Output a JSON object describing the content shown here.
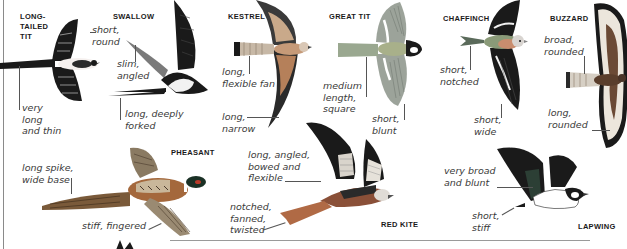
{
  "figure": {
    "birds": [
      {
        "id": "long-tailed-tit",
        "name": "LONG-\nTAILED\nTIT",
        "annotations": [
          {
            "part": "wing",
            "text": "short,\nround"
          },
          {
            "part": "tail",
            "text": "very\nlong\nand thin"
          }
        ]
      },
      {
        "id": "swallow",
        "name": "SWALLOW",
        "annotations": [
          {
            "part": "wing",
            "text": "slim,\nangled"
          },
          {
            "part": "tail",
            "text": "long, deeply\nforked"
          }
        ]
      },
      {
        "id": "kestrel",
        "name": "KESTREL",
        "annotations": [
          {
            "part": "tail",
            "text": "long,\nflexible fan"
          },
          {
            "part": "wing",
            "text": "long,\nnarrow"
          }
        ]
      },
      {
        "id": "great-tit",
        "name": "GREAT TIT",
        "annotations": [
          {
            "part": "tail",
            "text": "medium\nlength,\nsquare"
          },
          {
            "part": "wing",
            "text": "short,\nblunt"
          }
        ]
      },
      {
        "id": "chaffinch",
        "name": "CHAFFINCH",
        "annotations": [
          {
            "part": "tail",
            "text": "short,\nnotched"
          },
          {
            "part": "wing",
            "text": "short,\nwide"
          }
        ]
      },
      {
        "id": "buzzard",
        "name": "BUZZARD",
        "annotations": [
          {
            "part": "tail",
            "text": "broad,\nrounded"
          },
          {
            "part": "wing",
            "text": "long,\nrounded"
          }
        ]
      },
      {
        "id": "pheasant",
        "name": "PHEASANT",
        "annotations": [
          {
            "part": "tail",
            "text": "long spike,\nwide base"
          },
          {
            "part": "wing",
            "text": "stiff, fingered"
          }
        ]
      },
      {
        "id": "red-kite",
        "name": "RED KITE",
        "annotations": [
          {
            "part": "wing",
            "text": "long, angled,\nbowed and\nflexible"
          },
          {
            "part": "tail",
            "text": "notched,\nfanned,\ntwisted"
          }
        ]
      },
      {
        "id": "lapwing",
        "name": "LAPWING",
        "annotations": [
          {
            "part": "wing",
            "text": "very broad\nand blunt"
          },
          {
            "part": "tail",
            "text": "short,\nstiff"
          }
        ]
      }
    ],
    "colors": {
      "ink": "#1a1a1a",
      "annotation": "#3a3a3a",
      "rule": "#8a8a8a",
      "kestrel_back": "#b5805a",
      "great_tit_green": "#9aa888",
      "chaffinch_breast": "#c98d6e",
      "buzzard_brown": "#6b4a35",
      "pheasant_copper": "#a4683c",
      "red_kite_rufous": "#b06a45",
      "lapwing_green": "#2c3f35"
    }
  }
}
